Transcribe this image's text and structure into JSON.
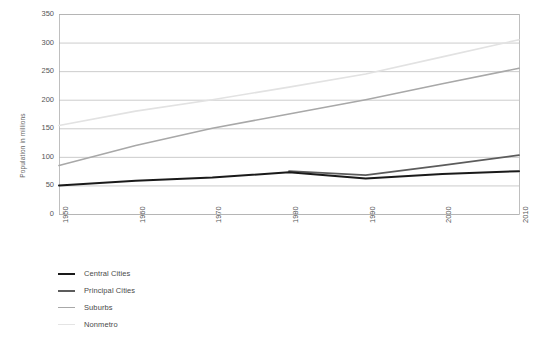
{
  "chart_data": {
    "type": "line",
    "title": "",
    "xlabel": "",
    "ylabel": "Population in millions",
    "x": [
      1950,
      1960,
      1970,
      1980,
      1990,
      2000,
      2010
    ],
    "xtick_labels": [
      "1950",
      "1960",
      "1970",
      "1980",
      "1990",
      "2000",
      "2010"
    ],
    "ytick_labels": [
      "0",
      "50",
      "100",
      "150",
      "200",
      "250",
      "300",
      "350"
    ],
    "ytick_values": [
      0,
      50,
      100,
      150,
      200,
      250,
      300,
      350
    ],
    "ylim": [
      0,
      350
    ],
    "xlim": [
      1950,
      2010
    ],
    "grid": "horizontal",
    "legend_position": "below-left",
    "series": [
      {
        "name": "Central Cities",
        "color": "#1a1a1a",
        "width": 2.0,
        "x": [
          1950,
          1960,
          1970,
          1980,
          1990,
          2000,
          2010
        ],
        "values": [
          50,
          58,
          64,
          73,
          62,
          70,
          75
        ]
      },
      {
        "name": "Principal Cities",
        "color": "#5c5c5c",
        "width": 1.8,
        "x": [
          1980,
          1990,
          2000,
          2010
        ],
        "values": [
          75,
          68,
          85,
          103
        ]
      },
      {
        "name": "Suburbs",
        "color": "#a8a8a8",
        "width": 1.6,
        "x": [
          1950,
          1960,
          1970,
          1980,
          1990,
          2000,
          2010
        ],
        "values": [
          85,
          120,
          150,
          175,
          200,
          228,
          255
        ]
      },
      {
        "name": "Nonmetro",
        "color": "#e2e2e2",
        "width": 1.6,
        "x": [
          1950,
          1960,
          1970,
          1980,
          1990,
          2000,
          2010
        ],
        "values": [
          155,
          180,
          200,
          222,
          245,
          275,
          305
        ]
      }
    ]
  },
  "axes": {
    "y_title": "Population in millions",
    "grid_color": "#b5b5b5",
    "frame_color": "#b0b0b0",
    "tick_text_color": "#555555"
  },
  "legend": {
    "items": [
      {
        "label": "Central Cities",
        "color": "#1a1a1a",
        "thickness": "2.6px"
      },
      {
        "label": "Principal Cities",
        "color": "#5c5c5c",
        "thickness": "2.0px"
      },
      {
        "label": "Suburbs",
        "color": "#a8a8a8",
        "thickness": "1.4px"
      },
      {
        "label": "Nonmetro",
        "color": "#e4e4e4",
        "thickness": "1.2px"
      }
    ]
  },
  "geometry": {
    "plot_left": 59,
    "plot_right": 519,
    "plot_top": 14,
    "plot_bottom": 214
  }
}
